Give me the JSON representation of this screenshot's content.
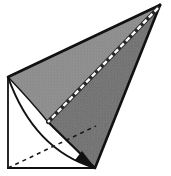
{
  "figure": {
    "title": "Oblique cone geometric construction",
    "style": "engraved stipple woodcut line drawing",
    "canvas": {
      "width": 171,
      "height": 176,
      "background": "#ffffff"
    },
    "colors": {
      "background": "#ffffff",
      "outline": "#111111",
      "shade_light": "#9a9a9a",
      "shade_mid": "#7e7e7e",
      "shade_dark": "#616161",
      "stipple": "#4a4a4a",
      "hidden_line": "#1a1a1a",
      "highlight_line": "#ffffff"
    },
    "points": {
      "apex": {
        "name": "apex",
        "x": 160,
        "y": 5
      },
      "left_vertex": {
        "name": "left-vertex",
        "x": 8,
        "y": 77
      },
      "bottom_vertex": {
        "name": "bottom-vertex",
        "x": 95,
        "y": 168
      },
      "bottom_left": {
        "name": "bottom-left-corner",
        "x": 8,
        "y": 168
      },
      "mid_fold": {
        "name": "mid-fold-point",
        "x": 48,
        "y": 122
      }
    },
    "faces": [
      {
        "name": "upper-shaded-face",
        "label": "Upper lateral face",
        "fill": "#8b8b8b",
        "path": "M 8 77 L 160 5 L 48 122 Z"
      },
      {
        "name": "lower-shaded-face",
        "label": "Lower lateral face",
        "fill": "#6e6e6e",
        "path": "M 160 5 L 95 168 L 48 122 Z"
      }
    ],
    "lines": [
      {
        "name": "top-edge",
        "label": "Top slant edge",
        "style": "solid",
        "color": "#111111",
        "width": 2.2,
        "from": "left_vertex",
        "to": "apex"
      },
      {
        "name": "right-edge",
        "label": "Right slant edge",
        "style": "solid",
        "color": "#111111",
        "width": 2.2,
        "from": "apex",
        "to": "bottom_vertex"
      },
      {
        "name": "left-vertical",
        "label": "Left vertical axis",
        "style": "solid",
        "color": "#111111",
        "width": 1.6,
        "from": "left_vertex",
        "to": "bottom_left"
      },
      {
        "name": "base-horizontal",
        "label": "Base horizontal line",
        "style": "solid",
        "color": "#111111",
        "width": 1.6,
        "from": "bottom_left",
        "to": "bottom_vertex"
      },
      {
        "name": "fold-edge",
        "label": "Visible fold edge",
        "style": "solid",
        "color": "#111111",
        "width": 2.0,
        "from": "mid_fold",
        "to": "bottom_vertex"
      },
      {
        "name": "apex-highlight",
        "label": "White dashed highlight from apex",
        "style": "dashed-white",
        "color": "#ffffff",
        "width": 2.0,
        "from": "apex",
        "to": "mid_fold"
      },
      {
        "name": "hidden-diagonal",
        "label": "Hidden diagonal (dashed)",
        "style": "dashed",
        "color": "#1a1a1a",
        "width": 1.5,
        "from": "bottom_left",
        "to": "apex"
      }
    ],
    "curves": [
      {
        "name": "base-arc",
        "label": "Elliptical base arc",
        "style": "solid",
        "color": "#111111",
        "width": 2.0,
        "path": "M 8 77 Q 34 150 95 168"
      },
      {
        "name": "inner-fold-arc",
        "label": "Inner fold arc",
        "style": "solid",
        "color": "#111111",
        "width": 1.4,
        "path": "M 8 77 Q 30 100 48 122"
      }
    ],
    "arrowheads": [
      {
        "name": "base-arrowhead",
        "label": "Arrowhead at bottom vertex",
        "at": "bottom_vertex",
        "angle": 28,
        "color": "#111111"
      }
    ],
    "annotations": []
  }
}
